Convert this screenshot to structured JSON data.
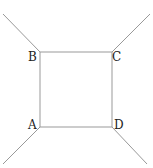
{
  "diagram": {
    "stroke_color": "#999999",
    "label_color": "#222222",
    "vertices": {
      "A": {
        "label": "A",
        "x": 40,
        "y": 127
      },
      "B": {
        "label": "B",
        "x": 40,
        "y": 52
      },
      "C": {
        "label": "C",
        "x": 112,
        "y": 52
      },
      "D": {
        "label": "D",
        "x": 112,
        "y": 127
      }
    },
    "edges": [
      [
        "A",
        "B"
      ],
      [
        "B",
        "C"
      ],
      [
        "C",
        "D"
      ],
      [
        "D",
        "A"
      ]
    ],
    "external_lines": [
      {
        "from": "B",
        "to": [
          3,
          14
        ]
      },
      {
        "from": "C",
        "to": [
          150,
          14
        ]
      },
      {
        "from": "A",
        "to": [
          3,
          164
        ]
      },
      {
        "from": "D",
        "to": [
          147,
          164
        ]
      }
    ]
  }
}
